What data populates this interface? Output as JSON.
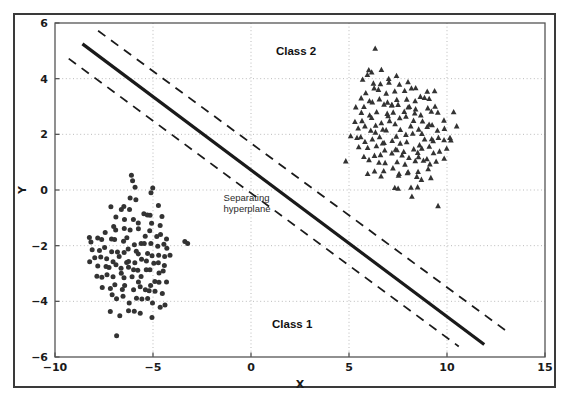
{
  "figure": {
    "background_color": "#ffffff",
    "frame_color": "#3a3a3a",
    "axes_color": "#555555",
    "grid_color": "#bbbbbb",
    "marker_color": "#333333",
    "line_color": "#1a1a1a"
  },
  "chart_data": {
    "type": "scatter",
    "title": "",
    "xlabel": "X",
    "ylabel": "Y",
    "xlim": [
      -10,
      15
    ],
    "ylim": [
      -6,
      6
    ],
    "xticks": [
      -10,
      -5,
      0,
      5,
      10,
      15
    ],
    "yticks": [
      -6,
      -4,
      -2,
      0,
      2,
      4,
      6
    ],
    "xtick_labels": [
      "−10",
      "−5",
      "0",
      "5",
      "10",
      "15"
    ],
    "ytick_labels": [
      "−6",
      "−4",
      "−2",
      "0",
      "2",
      "4",
      "6"
    ],
    "grid": true,
    "grid_style": "dotted",
    "legend_position": "none",
    "annotations": [
      {
        "text": "Class 2",
        "x": 2.3,
        "y": 5.0
      },
      {
        "text": "Class 1",
        "x": 2.1,
        "y": -4.8
      },
      {
        "text": "Separating",
        "x": -0.2,
        "y": -0.45
      },
      {
        "text": "hyperplane",
        "x": -0.2,
        "y": -0.85
      }
    ],
    "lines": [
      {
        "name": "separating-hyperplane",
        "style": "solid",
        "width": 3.2,
        "color": "#1a1a1a",
        "x": [
          -8.6,
          11.9
        ],
        "y": [
          5.25,
          -5.55
        ]
      },
      {
        "name": "upper-margin",
        "style": "dashed",
        "width": 1.8,
        "color": "#1a1a1a",
        "x": [
          -7.8,
          13.0
        ],
        "y": [
          5.72,
          -5.05
        ]
      },
      {
        "name": "lower-margin",
        "style": "dashed",
        "width": 1.8,
        "color": "#1a1a1a",
        "x": [
          -9.3,
          10.6
        ],
        "y": [
          4.72,
          -5.62
        ]
      }
    ],
    "series": [
      {
        "name": "Class 1",
        "marker": "circle",
        "color": "#333333",
        "center": [
          -6.0,
          -2.3
        ],
        "n_points": 230,
        "points": [
          [
            -6.05,
            0.42
          ],
          [
            -6.02,
            0.08
          ],
          [
            -5.12,
            -0.02
          ],
          [
            -6.08,
            -0.22
          ],
          [
            -6.52,
            -0.55
          ],
          [
            -7.05,
            -0.68
          ],
          [
            -6.7,
            -0.6
          ],
          [
            -6.3,
            -0.72
          ],
          [
            -5.95,
            -0.45
          ],
          [
            -5.55,
            -0.78
          ],
          [
            -5.2,
            -0.85
          ],
          [
            -4.82,
            -0.62
          ],
          [
            -4.62,
            -0.95
          ],
          [
            -6.95,
            -0.95
          ],
          [
            -6.4,
            -1.05
          ],
          [
            -6.05,
            -1.1
          ],
          [
            -5.7,
            -1.15
          ],
          [
            -5.38,
            -1.0
          ],
          [
            -5.02,
            -1.22
          ],
          [
            -4.7,
            -1.35
          ],
          [
            -7.45,
            -1.5
          ],
          [
            -7.1,
            -1.32
          ],
          [
            -6.8,
            -1.45
          ],
          [
            -6.45,
            -1.3
          ],
          [
            -6.12,
            -1.52
          ],
          [
            -5.82,
            -1.42
          ],
          [
            -5.5,
            -1.58
          ],
          [
            -5.18,
            -1.48
          ],
          [
            -4.88,
            -1.62
          ],
          [
            -4.55,
            -1.55
          ],
          [
            -4.35,
            -1.72
          ],
          [
            -7.8,
            -1.78
          ],
          [
            -7.55,
            -1.68
          ],
          [
            -7.2,
            -1.82
          ],
          [
            -6.9,
            -1.75
          ],
          [
            -6.6,
            -1.88
          ],
          [
            -6.28,
            -1.8
          ],
          [
            -5.98,
            -1.95
          ],
          [
            -5.68,
            -1.85
          ],
          [
            -5.38,
            -1.98
          ],
          [
            -5.08,
            -1.9
          ],
          [
            -4.78,
            -2.02
          ],
          [
            -4.5,
            -1.95
          ],
          [
            -4.25,
            -2.1
          ],
          [
            -3.3,
            -1.85
          ],
          [
            -8.1,
            -2.05
          ],
          [
            -7.75,
            -2.15
          ],
          [
            -7.45,
            -2.08
          ],
          [
            -7.15,
            -2.2
          ],
          [
            -6.85,
            -2.12
          ],
          [
            -6.55,
            -2.25
          ],
          [
            -6.25,
            -2.18
          ],
          [
            -5.95,
            -2.3
          ],
          [
            -5.65,
            -2.22
          ],
          [
            -5.35,
            -2.35
          ],
          [
            -5.05,
            -2.28
          ],
          [
            -4.75,
            -2.4
          ],
          [
            -4.45,
            -2.32
          ],
          [
            -4.2,
            -2.45
          ],
          [
            -7.95,
            -2.35
          ],
          [
            -7.65,
            -2.45
          ],
          [
            -7.35,
            -2.38
          ],
          [
            -7.05,
            -2.5
          ],
          [
            -6.75,
            -2.42
          ],
          [
            -6.45,
            -2.55
          ],
          [
            -6.15,
            -2.48
          ],
          [
            -5.85,
            -2.6
          ],
          [
            -5.55,
            -2.52
          ],
          [
            -5.25,
            -2.65
          ],
          [
            -4.95,
            -2.58
          ],
          [
            -4.65,
            -2.7
          ],
          [
            -4.38,
            -2.62
          ],
          [
            -8.25,
            -2.68
          ],
          [
            -7.85,
            -2.75
          ],
          [
            -7.5,
            -2.68
          ],
          [
            -7.2,
            -2.8
          ],
          [
            -6.9,
            -2.72
          ],
          [
            -6.6,
            -2.85
          ],
          [
            -6.3,
            -2.78
          ],
          [
            -6.0,
            -2.9
          ],
          [
            -5.7,
            -2.82
          ],
          [
            -5.4,
            -2.95
          ],
          [
            -5.1,
            -2.88
          ],
          [
            -4.8,
            -3.0
          ],
          [
            -4.5,
            -2.92
          ],
          [
            -7.9,
            -3.05
          ],
          [
            -7.6,
            -3.12
          ],
          [
            -7.3,
            -3.05
          ],
          [
            -7.0,
            -3.18
          ],
          [
            -6.7,
            -3.1
          ],
          [
            -6.4,
            -3.22
          ],
          [
            -6.1,
            -3.15
          ],
          [
            -5.8,
            -3.28
          ],
          [
            -5.5,
            -3.2
          ],
          [
            -5.2,
            -3.32
          ],
          [
            -4.9,
            -3.25
          ],
          [
            -4.6,
            -3.38
          ],
          [
            -4.3,
            -3.3
          ],
          [
            -7.55,
            -3.45
          ],
          [
            -7.25,
            -3.52
          ],
          [
            -6.95,
            -3.45
          ],
          [
            -6.65,
            -3.58
          ],
          [
            -6.35,
            -3.5
          ],
          [
            -6.05,
            -3.62
          ],
          [
            -5.75,
            -3.55
          ],
          [
            -5.45,
            -3.68
          ],
          [
            -5.15,
            -3.6
          ],
          [
            -4.85,
            -3.72
          ],
          [
            -4.55,
            -3.65
          ],
          [
            -7.1,
            -3.85
          ],
          [
            -6.8,
            -3.92
          ],
          [
            -6.5,
            -3.85
          ],
          [
            -6.2,
            -3.98
          ],
          [
            -5.9,
            -3.9
          ],
          [
            -5.6,
            -4.02
          ],
          [
            -5.3,
            -3.95
          ],
          [
            -5.0,
            -4.08
          ],
          [
            -4.7,
            -4.15
          ],
          [
            -4.45,
            -4.05
          ],
          [
            -7.25,
            -4.4
          ],
          [
            -6.65,
            -4.5
          ],
          [
            -6.3,
            -4.35
          ],
          [
            -5.95,
            -4.42
          ],
          [
            -5.6,
            -4.38
          ],
          [
            -4.95,
            -4.62
          ],
          [
            -6.9,
            -5.25
          ],
          [
            -8.3,
            -1.75
          ],
          [
            -8.25,
            -1.9
          ],
          [
            -3.3,
            -1.85
          ],
          [
            -6.05,
            0.42
          ],
          [
            -5.12,
            -0.02
          ]
        ]
      },
      {
        "name": "Class 2",
        "marker": "triangle",
        "color": "#333333",
        "center": [
          8.0,
          2.2
        ],
        "n_points": 215,
        "points": [
          [
            6.4,
            5.05
          ],
          [
            5.9,
            4.28
          ],
          [
            6.15,
            4.22
          ],
          [
            6.75,
            4.25
          ],
          [
            6.0,
            4.05
          ],
          [
            5.78,
            3.95
          ],
          [
            6.35,
            3.9
          ],
          [
            6.95,
            3.98
          ],
          [
            7.35,
            4.08
          ],
          [
            7.1,
            3.82
          ],
          [
            6.6,
            3.75
          ],
          [
            6.2,
            3.68
          ],
          [
            7.6,
            3.78
          ],
          [
            8.0,
            3.85
          ],
          [
            8.4,
            3.72
          ],
          [
            5.85,
            3.55
          ],
          [
            6.45,
            3.5
          ],
          [
            6.9,
            3.45
          ],
          [
            7.3,
            3.55
          ],
          [
            7.75,
            3.48
          ],
          [
            8.2,
            3.55
          ],
          [
            8.55,
            3.42
          ],
          [
            8.9,
            3.5
          ],
          [
            5.6,
            3.3
          ],
          [
            6.05,
            3.25
          ],
          [
            6.5,
            3.3
          ],
          [
            6.95,
            3.22
          ],
          [
            7.4,
            3.3
          ],
          [
            7.85,
            3.22
          ],
          [
            8.3,
            3.3
          ],
          [
            8.75,
            3.2
          ],
          [
            9.2,
            3.25
          ],
          [
            5.35,
            3.05
          ],
          [
            5.8,
            3.0
          ],
          [
            6.25,
            3.05
          ],
          [
            6.7,
            2.98
          ],
          [
            7.15,
            3.05
          ],
          [
            7.6,
            2.98
          ],
          [
            8.05,
            3.05
          ],
          [
            8.5,
            2.95
          ],
          [
            8.95,
            3.0
          ],
          [
            9.4,
            2.9
          ],
          [
            5.55,
            2.8
          ],
          [
            6.0,
            2.75
          ],
          [
            6.45,
            2.8
          ],
          [
            6.9,
            2.72
          ],
          [
            7.35,
            2.8
          ],
          [
            7.8,
            2.72
          ],
          [
            8.25,
            2.8
          ],
          [
            8.7,
            2.7
          ],
          [
            9.15,
            2.75
          ],
          [
            9.6,
            2.68
          ],
          [
            10.3,
            2.85
          ],
          [
            5.25,
            2.55
          ],
          [
            5.7,
            2.5
          ],
          [
            6.15,
            2.55
          ],
          [
            6.6,
            2.48
          ],
          [
            7.05,
            2.55
          ],
          [
            7.5,
            2.48
          ],
          [
            7.95,
            2.55
          ],
          [
            8.4,
            2.45
          ],
          [
            8.85,
            2.5
          ],
          [
            9.3,
            2.42
          ],
          [
            9.75,
            2.48
          ],
          [
            10.4,
            2.38
          ],
          [
            5.45,
            2.3
          ],
          [
            5.9,
            2.25
          ],
          [
            6.35,
            2.3
          ],
          [
            6.8,
            2.22
          ],
          [
            7.25,
            2.3
          ],
          [
            7.7,
            2.22
          ],
          [
            8.15,
            2.3
          ],
          [
            8.6,
            2.2
          ],
          [
            9.05,
            2.25
          ],
          [
            9.5,
            2.18
          ],
          [
            9.95,
            2.22
          ],
          [
            5.15,
            2.05
          ],
          [
            5.6,
            2.0
          ],
          [
            6.05,
            2.05
          ],
          [
            6.5,
            1.98
          ],
          [
            6.95,
            2.05
          ],
          [
            7.4,
            1.98
          ],
          [
            7.85,
            2.05
          ],
          [
            8.3,
            1.95
          ],
          [
            8.75,
            2.0
          ],
          [
            9.2,
            1.92
          ],
          [
            9.65,
            1.98
          ],
          [
            10.15,
            1.9
          ],
          [
            5.35,
            1.8
          ],
          [
            5.8,
            1.75
          ],
          [
            6.25,
            1.8
          ],
          [
            6.7,
            1.72
          ],
          [
            7.15,
            1.8
          ],
          [
            7.6,
            1.72
          ],
          [
            8.05,
            1.8
          ],
          [
            8.5,
            1.7
          ],
          [
            8.95,
            1.75
          ],
          [
            9.4,
            1.68
          ],
          [
            9.85,
            1.72
          ],
          [
            10.25,
            1.82
          ],
          [
            5.55,
            1.55
          ],
          [
            6.0,
            1.5
          ],
          [
            6.45,
            1.55
          ],
          [
            6.9,
            1.48
          ],
          [
            7.35,
            1.55
          ],
          [
            7.8,
            1.48
          ],
          [
            8.25,
            1.55
          ],
          [
            8.7,
            1.45
          ],
          [
            9.15,
            1.5
          ],
          [
            9.6,
            1.42
          ],
          [
            10.05,
            1.48
          ],
          [
            5.8,
            1.3
          ],
          [
            6.25,
            1.25
          ],
          [
            6.7,
            1.3
          ],
          [
            7.15,
            1.22
          ],
          [
            7.6,
            1.3
          ],
          [
            8.05,
            1.22
          ],
          [
            8.5,
            1.3
          ],
          [
            8.95,
            1.2
          ],
          [
            9.4,
            1.25
          ],
          [
            9.85,
            1.18
          ],
          [
            4.75,
            1.05
          ],
          [
            6.05,
            1.0
          ],
          [
            6.5,
            1.05
          ],
          [
            6.95,
            0.98
          ],
          [
            7.4,
            1.05
          ],
          [
            7.85,
            0.98
          ],
          [
            8.3,
            1.05
          ],
          [
            8.75,
            0.95
          ],
          [
            9.2,
            1.0
          ],
          [
            9.55,
            0.95
          ],
          [
            6.3,
            0.75
          ],
          [
            6.75,
            0.7
          ],
          [
            7.2,
            0.75
          ],
          [
            7.65,
            0.68
          ],
          [
            8.1,
            0.75
          ],
          [
            8.55,
            0.68
          ],
          [
            9.0,
            0.72
          ],
          [
            7.45,
            0.45
          ],
          [
            7.9,
            0.5
          ],
          [
            8.35,
            0.42
          ],
          [
            8.8,
            0.48
          ],
          [
            9.25,
            0.4
          ],
          [
            7.3,
            0.18
          ],
          [
            8.1,
            0.1
          ],
          [
            8.6,
            0.15
          ],
          [
            8.15,
            -0.25
          ],
          [
            9.55,
            -0.5
          ],
          [
            7.5,
            0.02
          ],
          [
            6.55,
            0.5
          ],
          [
            5.95,
            0.6
          ],
          [
            6.45,
            2.05
          ],
          [
            7.05,
            2.58
          ],
          [
            7.55,
            1.35
          ],
          [
            8.05,
            2.9
          ],
          [
            8.45,
            1.15
          ],
          [
            8.9,
            2.35
          ],
          [
            7.25,
            3.15
          ],
          [
            6.85,
            1.65
          ],
          [
            9.3,
            3.6
          ]
        ]
      }
    ]
  }
}
